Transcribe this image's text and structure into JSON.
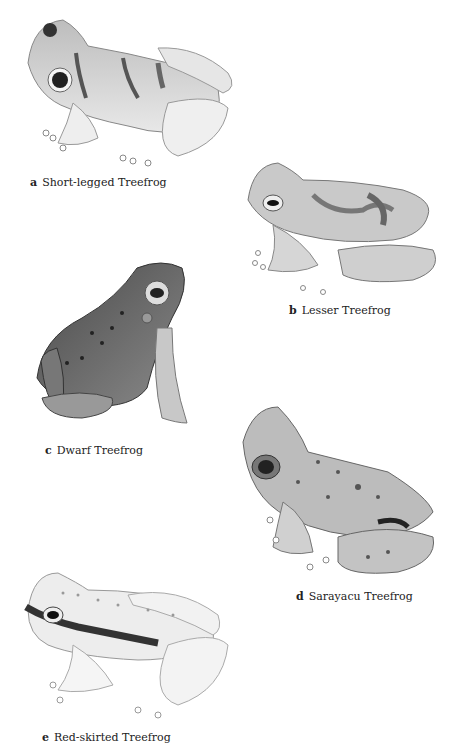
{
  "plate": {
    "frogs": [
      {
        "letter": "a",
        "name": "Short-legged Treefrog"
      },
      {
        "letter": "b",
        "name": "Lesser Treefrog"
      },
      {
        "letter": "c",
        "name": "Dwarf Treefrog"
      },
      {
        "letter": "d",
        "name": "Sarayacu Treefrog"
      },
      {
        "letter": "e",
        "name": "Red-skirted Treefrog"
      }
    ]
  }
}
